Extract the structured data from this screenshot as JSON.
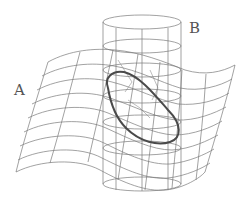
{
  "diagram": {
    "labels": {
      "surface": "A",
      "cylinder": "B"
    },
    "colors": {
      "mesh": "#7a7a7a",
      "intersection_curve": "#4a4a4a",
      "label": "#555555",
      "background": "#ffffff"
    }
  }
}
